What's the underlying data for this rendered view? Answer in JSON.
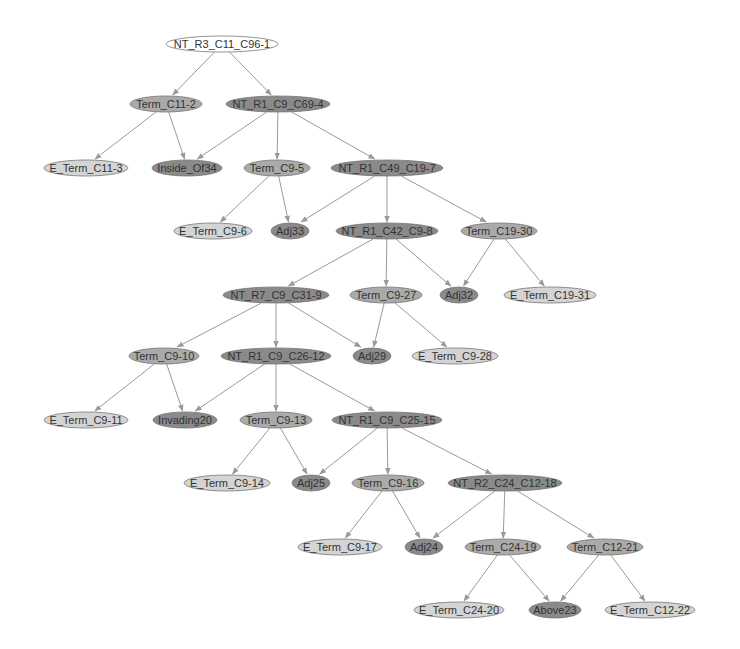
{
  "diagram": {
    "type": "parse-tree",
    "colors": {
      "white": "#ffffff",
      "light": "#d4d4d4",
      "mid": "#aaaaaa",
      "dark": "#8a8a8a",
      "edge": "#9a9a9a",
      "stroke": "#777777"
    },
    "nodes": [
      {
        "id": "n1",
        "label": "NT_R3_C11_C96-1",
        "x": 222,
        "y": 44,
        "rx": 56,
        "shade": "white"
      },
      {
        "id": "n2",
        "label": "Term_C11-2",
        "x": 166,
        "y": 104,
        "rx": 36,
        "shade": "mid"
      },
      {
        "id": "n3",
        "label": "NT_R1_C9_C69-4",
        "x": 278,
        "y": 104,
        "rx": 52,
        "shade": "dark"
      },
      {
        "id": "n4",
        "label": "E_Term_C11-3",
        "x": 86,
        "y": 168,
        "rx": 42,
        "shade": "light"
      },
      {
        "id": "n5",
        "label": "Inside_Of34",
        "x": 187,
        "y": 168,
        "rx": 35,
        "shade": "dark"
      },
      {
        "id": "n6",
        "label": "Term_C9-5",
        "x": 277,
        "y": 168,
        "rx": 33,
        "shade": "mid"
      },
      {
        "id": "n7",
        "label": "NT_R1_C49_C19-7",
        "x": 387,
        "y": 168,
        "rx": 56,
        "shade": "dark"
      },
      {
        "id": "n8",
        "label": "E_Term_C9-6",
        "x": 213,
        "y": 231,
        "rx": 39,
        "shade": "light"
      },
      {
        "id": "n9",
        "label": "Adj33",
        "x": 290,
        "y": 231,
        "rx": 19,
        "shade": "dark"
      },
      {
        "id": "n10",
        "label": "NT_R1_C42_C9-8",
        "x": 387,
        "y": 231,
        "rx": 51,
        "shade": "dark"
      },
      {
        "id": "n11",
        "label": "Term_C19-30",
        "x": 499,
        "y": 231,
        "rx": 38,
        "shade": "mid"
      },
      {
        "id": "n12",
        "label": "NT_R7_C9_C31-9",
        "x": 276,
        "y": 295,
        "rx": 53,
        "shade": "dark"
      },
      {
        "id": "n13",
        "label": "Term_C9-27",
        "x": 386,
        "y": 295,
        "rx": 36,
        "shade": "mid"
      },
      {
        "id": "n14",
        "label": "Adj32",
        "x": 459,
        "y": 295,
        "rx": 19,
        "shade": "dark"
      },
      {
        "id": "n15",
        "label": "E_Term_C19-31",
        "x": 550,
        "y": 295,
        "rx": 46,
        "shade": "light"
      },
      {
        "id": "n16",
        "label": "Term_C9-10",
        "x": 164,
        "y": 356,
        "rx": 35,
        "shade": "mid"
      },
      {
        "id": "n17",
        "label": "NT_R1_C9_C26-12",
        "x": 276,
        "y": 356,
        "rx": 55,
        "shade": "dark"
      },
      {
        "id": "n18",
        "label": "Adj29",
        "x": 372,
        "y": 356,
        "rx": 19,
        "shade": "dark"
      },
      {
        "id": "n19",
        "label": "E_Term_C9-28",
        "x": 455,
        "y": 356,
        "rx": 43,
        "shade": "light"
      },
      {
        "id": "n20",
        "label": "E_Term_C9-11",
        "x": 86,
        "y": 420,
        "rx": 42,
        "shade": "light"
      },
      {
        "id": "n21",
        "label": "Invading20",
        "x": 185,
        "y": 420,
        "rx": 32,
        "shade": "dark"
      },
      {
        "id": "n22",
        "label": "Term_C9-13",
        "x": 276,
        "y": 420,
        "rx": 36,
        "shade": "mid"
      },
      {
        "id": "n23",
        "label": "NT_R1_C9_C25-15",
        "x": 387,
        "y": 420,
        "rx": 55,
        "shade": "dark"
      },
      {
        "id": "n24",
        "label": "E_Term_C9-14",
        "x": 227,
        "y": 483,
        "rx": 43,
        "shade": "light"
      },
      {
        "id": "n25",
        "label": "Adj25",
        "x": 311,
        "y": 483,
        "rx": 19,
        "shade": "dark"
      },
      {
        "id": "n26",
        "label": "Term_C9-16",
        "x": 388,
        "y": 483,
        "rx": 36,
        "shade": "mid"
      },
      {
        "id": "n27",
        "label": "NT_R2_C24_C12-18",
        "x": 505,
        "y": 483,
        "rx": 57,
        "shade": "dark"
      },
      {
        "id": "n28",
        "label": "E_Term_C9-17",
        "x": 340,
        "y": 547,
        "rx": 42,
        "shade": "light"
      },
      {
        "id": "n29",
        "label": "Adj24",
        "x": 424,
        "y": 547,
        "rx": 19,
        "shade": "dark"
      },
      {
        "id": "n30",
        "label": "Term_C24-19",
        "x": 503,
        "y": 547,
        "rx": 38,
        "shade": "mid"
      },
      {
        "id": "n31",
        "label": "Term_C12-21",
        "x": 605,
        "y": 547,
        "rx": 38,
        "shade": "mid"
      },
      {
        "id": "n32",
        "label": "E_Term_C24-20",
        "x": 459,
        "y": 610,
        "rx": 45,
        "shade": "light"
      },
      {
        "id": "n33",
        "label": "Above23",
        "x": 555,
        "y": 610,
        "rx": 26,
        "shade": "dark"
      },
      {
        "id": "n34",
        "label": "E_Term_C12-22",
        "x": 650,
        "y": 610,
        "rx": 45,
        "shade": "light"
      }
    ],
    "edges": [
      [
        "n1",
        "n2"
      ],
      [
        "n1",
        "n3"
      ],
      [
        "n2",
        "n4"
      ],
      [
        "n2",
        "n5"
      ],
      [
        "n3",
        "n5"
      ],
      [
        "n3",
        "n6"
      ],
      [
        "n3",
        "n7"
      ],
      [
        "n6",
        "n8"
      ],
      [
        "n6",
        "n9"
      ],
      [
        "n7",
        "n9"
      ],
      [
        "n7",
        "n10"
      ],
      [
        "n7",
        "n11"
      ],
      [
        "n10",
        "n12"
      ],
      [
        "n10",
        "n13"
      ],
      [
        "n10",
        "n14"
      ],
      [
        "n11",
        "n14"
      ],
      [
        "n11",
        "n15"
      ],
      [
        "n12",
        "n16"
      ],
      [
        "n12",
        "n17"
      ],
      [
        "n12",
        "n18"
      ],
      [
        "n13",
        "n18"
      ],
      [
        "n13",
        "n19"
      ],
      [
        "n16",
        "n20"
      ],
      [
        "n16",
        "n21"
      ],
      [
        "n17",
        "n21"
      ],
      [
        "n17",
        "n22"
      ],
      [
        "n17",
        "n23"
      ],
      [
        "n22",
        "n24"
      ],
      [
        "n22",
        "n25"
      ],
      [
        "n23",
        "n25"
      ],
      [
        "n23",
        "n26"
      ],
      [
        "n23",
        "n27"
      ],
      [
        "n26",
        "n28"
      ],
      [
        "n26",
        "n29"
      ],
      [
        "n27",
        "n29"
      ],
      [
        "n27",
        "n30"
      ],
      [
        "n27",
        "n31"
      ],
      [
        "n30",
        "n32"
      ],
      [
        "n30",
        "n33"
      ],
      [
        "n31",
        "n33"
      ],
      [
        "n31",
        "n34"
      ]
    ]
  }
}
